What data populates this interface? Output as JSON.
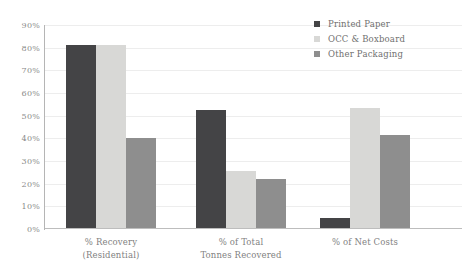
{
  "chart_data": {
    "type": "bar",
    "title": "",
    "subtitle": "",
    "xlabel": "",
    "ylabel": "",
    "ylim": [
      0,
      90
    ],
    "y_tick_labels": [
      "90%",
      "80%",
      "70%",
      "60%",
      "50%",
      "40%",
      "30%",
      "20%",
      "10%",
      "0%"
    ],
    "y_ticks": [
      90,
      80,
      70,
      60,
      50,
      40,
      30,
      20,
      10,
      0
    ],
    "grid": true,
    "legend_position": "top-right",
    "categories": [
      "% Recovery (Residential)",
      "% of Total Tonnes Recovered",
      "% of Net Costs"
    ],
    "category_lines": [
      [
        "% Recovery",
        "(Residential)"
      ],
      [
        "% of Total",
        "Tonnes Recovered"
      ],
      [
        "% of Net Costs"
      ]
    ],
    "series": [
      {
        "name": "Printed Paper",
        "color": "#444446",
        "values": [
          81,
          52.5,
          5
        ]
      },
      {
        "name": "OCC & Boxboard",
        "color": "#d8d8d6",
        "values": [
          81,
          25.5,
          53.5
        ]
      },
      {
        "name": "Other Packaging",
        "color": "#8e8e8e",
        "values": [
          40,
          22,
          41.5
        ]
      }
    ]
  },
  "legend": {
    "items": [
      {
        "label": "Printed Paper"
      },
      {
        "label": "OCC & Boxboard"
      },
      {
        "label": "Other Packaging"
      }
    ]
  },
  "axis": {
    "y_labels": [
      "90%",
      "80%",
      "70%",
      "60%",
      "50%",
      "40%",
      "30%",
      "20%",
      "10%",
      "0%"
    ]
  }
}
